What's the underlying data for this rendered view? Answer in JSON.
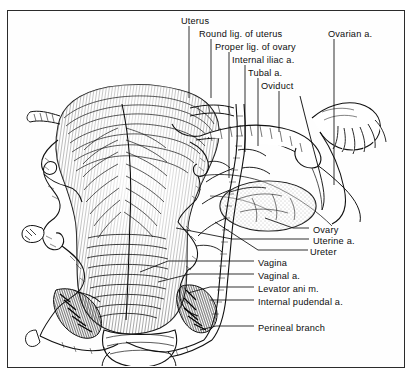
{
  "figure": {
    "kind": "anatomical-illustration",
    "style": "black-and-white line engraving with hatched shading",
    "border_color": "#2b2b2b",
    "background_color": "#ffffff",
    "ink_color": "#0d0d0d"
  },
  "labels": {
    "top": [
      {
        "id": "uterus",
        "text": "Uterus",
        "x": 181,
        "y": 16,
        "leader_x": 189,
        "leader_y1": 26,
        "leader_y2": 98
      },
      {
        "id": "round-lig-uterus",
        "text": "Round lig. of uterus",
        "x": 199,
        "y": 29,
        "leader_x": 211,
        "leader_y1": 39,
        "leader_y2": 98
      },
      {
        "id": "proper-lig-ovary",
        "text": "Proper lig. of ovary",
        "x": 215,
        "y": 42,
        "leader_x": 229,
        "leader_y1": 52,
        "leader_y2": 178
      },
      {
        "id": "internal-iliac-a",
        "text": "Internal iliac a.",
        "x": 232,
        "y": 55,
        "leader_x": 245,
        "leader_y1": 65,
        "leader_y2": 152
      },
      {
        "id": "tubal-a",
        "text": "Tubal a.",
        "x": 248,
        "y": 68,
        "leader_x": 258,
        "leader_y1": 78,
        "leader_y2": 146
      },
      {
        "id": "oviduct",
        "text": "Oviduct",
        "x": 261,
        "y": 81,
        "leader_x": 279,
        "leader_y1": 91,
        "leader_y2": 132
      },
      {
        "id": "ovarian-a",
        "text": "Ovarian a.",
        "x": 328,
        "y": 29,
        "leader_x": 334,
        "leader_y1": 39,
        "leader_y2": 185
      }
    ],
    "right": [
      {
        "id": "ovary",
        "text": "Ovary",
        "x": 313,
        "y": 230,
        "leader_x1": 293,
        "leader_x2": 309,
        "leader_y": 228,
        "anchor_x": 265,
        "anchor_y": 218
      },
      {
        "id": "uterine-a",
        "text": "Uterine a.",
        "x": 313,
        "y": 241,
        "leader_x1": 232,
        "leader_x2": 309,
        "leader_y": 239,
        "anchor_x": 176,
        "anchor_y": 228
      },
      {
        "id": "ureter",
        "text": "Ureter",
        "x": 310,
        "y": 252,
        "leader_x1": 258,
        "leader_x2": 308,
        "leader_y": 250,
        "anchor_x": 215,
        "anchor_y": 222
      },
      {
        "id": "vagina",
        "text": "Vagina",
        "x": 258,
        "y": 263,
        "leader_x1": 168,
        "leader_x2": 254,
        "leader_y": 261,
        "anchor_x": 140,
        "anchor_y": 272
      },
      {
        "id": "vaginal-a",
        "text": "Vaginal a.",
        "x": 258,
        "y": 276,
        "leader_x1": 190,
        "leader_x2": 254,
        "leader_y": 274,
        "anchor_x": 158,
        "anchor_y": 282
      },
      {
        "id": "levator-ani-m",
        "text": "Levator ani m.",
        "x": 258,
        "y": 289,
        "leader_x1": 210,
        "leader_x2": 254,
        "leader_y": 287,
        "anchor_x": 188,
        "anchor_y": 293
      },
      {
        "id": "internal-pudendal-a",
        "text": "Internal pudendal a.",
        "x": 258,
        "y": 302,
        "leader_x1": 222,
        "leader_x2": 254,
        "leader_y": 300,
        "anchor_x": 210,
        "anchor_y": 300
      },
      {
        "id": "perineal-branch",
        "text": "Perineal branch",
        "x": 258,
        "y": 328,
        "leader_x1": 216,
        "leader_x2": 254,
        "leader_y": 326,
        "anchor_x": 200,
        "anchor_y": 330
      }
    ]
  },
  "structures": [
    {
      "name": "uterus-body",
      "description": "large hatched uterine body, fundus at top"
    },
    {
      "name": "cervix",
      "description": "narrowed lower uterine segment"
    },
    {
      "name": "vagina",
      "description": "hatched vaginal canal below cervix"
    },
    {
      "name": "oviduct",
      "description": "coiled uterine tube running to the right with fimbriae"
    },
    {
      "name": "fimbriae",
      "description": "finger-like fringes at lateral end of oviduct"
    },
    {
      "name": "ovary",
      "description": "ovoid stippled gland below oviduct on the right"
    },
    {
      "name": "broad-ligament",
      "description": "membranous sheet suspending tube and ovary"
    },
    {
      "name": "uterine-vessels",
      "description": "tortuous coiled arteries flanking the uterus"
    },
    {
      "name": "levator-ani",
      "description": "dark hatched muscle bands at lower left and right"
    }
  ]
}
